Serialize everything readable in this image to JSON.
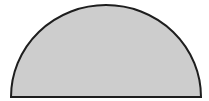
{
  "diagram": {
    "shape": "semicircle",
    "orientation": "flat-side-down",
    "fill_color": "#cdcdcd",
    "stroke_color": "#1e1e1e",
    "stroke_width": 2,
    "geometry": {
      "center_x": 106,
      "center_y": 97,
      "radius_x": 95,
      "radius_y": 92
    }
  }
}
